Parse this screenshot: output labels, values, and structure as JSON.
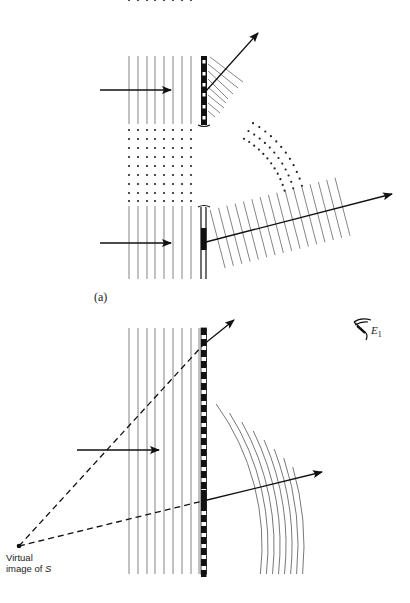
{
  "figure": {
    "panel_a_label": "(a)",
    "virtual_image_label_line1": "Virtual",
    "virtual_image_label_line2_prefix": "image of ",
    "virtual_image_label_source": "S",
    "eye_label": "E",
    "eye_label_subscript": "1",
    "colors": {
      "ink": "#111111",
      "wavefront": "#555555",
      "background": "#ffffff"
    }
  },
  "panel_a": {
    "incident_wavefront_count": 8,
    "dot_lattice_rows": 9,
    "dot_lattice_cols": 8,
    "upper_grating": "striped",
    "lower_grating": "single-slit-block"
  },
  "panel_b": {
    "incident_wavefront_count": 8,
    "diffracted_arc_count": 16,
    "virtual_source": "S"
  }
}
